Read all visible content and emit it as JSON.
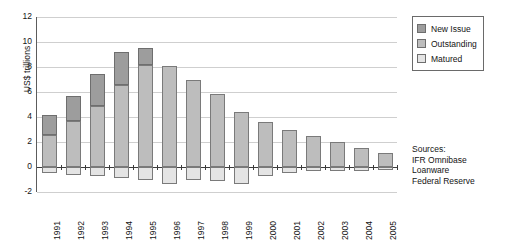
{
  "chart_data": {
    "type": "bar",
    "title": "",
    "subtitle": "",
    "xlabel": "",
    "ylabel": "US$ trillions",
    "ylim": [
      -2,
      12
    ],
    "yticks": [
      12,
      10,
      8,
      6,
      4,
      2,
      0,
      -2
    ],
    "grid": true,
    "stacked": true,
    "legend_position": "top-right",
    "categories": [
      "1991",
      "1992",
      "1993",
      "1994",
      "1995",
      "1996",
      "1997",
      "1998",
      "1999",
      "2000",
      "2001",
      "2002",
      "2003",
      "2004",
      "2005"
    ],
    "series": [
      {
        "name": "Matured",
        "color": "#e4e4e4",
        "values": [
          -0.5,
          -0.6,
          -0.7,
          -0.9,
          -1.0,
          -1.35,
          -1.05,
          -1.1,
          -1.35,
          -0.75,
          -0.5,
          -0.35,
          -0.3,
          -0.3,
          -0.25
        ]
      },
      {
        "name": "Outstanding",
        "color": "#bdbdbd",
        "values": [
          2.6,
          3.7,
          4.9,
          6.6,
          8.2,
          8.05,
          7.0,
          5.85,
          4.4,
          3.6,
          3.0,
          2.5,
          2.0,
          1.5,
          1.1
        ]
      },
      {
        "name": "New Issue",
        "color": "#9d9d9d",
        "values": [
          1.6,
          2.0,
          2.55,
          2.6,
          1.3,
          0,
          0,
          0,
          0,
          0,
          0,
          0,
          0,
          0,
          0
        ]
      }
    ],
    "bar_totals_positive": [
      4.2,
      5.7,
      7.45,
      9.2,
      9.5,
      8.05,
      7.0,
      5.85,
      4.4,
      3.6,
      3.0,
      2.5,
      2.0,
      1.5,
      1.1
    ],
    "annotations": {
      "sources_lines": [
        "Sources:",
        "IFR Omnibase",
        "Loanware",
        "Federal Reserve"
      ]
    }
  },
  "legend": {
    "items": [
      {
        "label": "New Issue",
        "color": "#9d9d9d"
      },
      {
        "label": "Outstanding",
        "color": "#bdbdbd"
      },
      {
        "label": "Matured",
        "color": "#e4e4e4"
      }
    ]
  },
  "sources": {
    "line1": "Sources:",
    "line2": "IFR Omnibase",
    "line3": "Loanware",
    "line4": "Federal Reserve"
  },
  "colors": {
    "new_issue": "#9d9d9d",
    "outstanding": "#bdbdbd",
    "matured": "#e4e4e4",
    "axis": "#3d3d3d",
    "grid": "#cfcfcf",
    "text": "#141414"
  }
}
